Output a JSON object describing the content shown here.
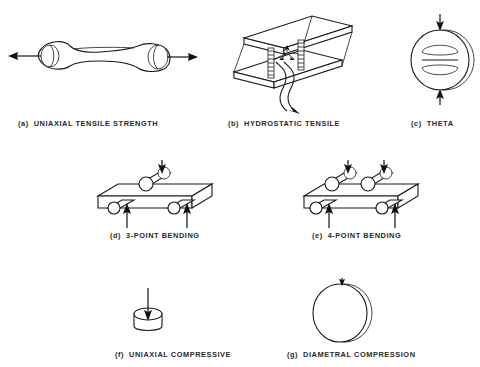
{
  "figure": {
    "background_color": "#ffffff",
    "line_color": "#1a1a1a",
    "caption_color": "#2a2a2a",
    "panel_count": 7
  },
  "panels": [
    {
      "tag": "(a)",
      "label": "UNIAXIAL TENSILE STRENGTH",
      "specimen": "dogbone-tensile-bar",
      "loading": "two opposing horizontal tensile arrows",
      "arrows": 2,
      "arrow_direction": "outward-horizontal"
    },
    {
      "tag": "(b)",
      "label": "HYDROSTATIC TENSILE",
      "specimen": "cylindrical-specimen-between-parallel-plates",
      "loading": "internal pressurized fluid via curved tube",
      "arrows": 3,
      "arrow_direction": "radial-outward"
    },
    {
      "tag": "(c)",
      "label": "THETA",
      "specimen": "theta-ring-with-central-web",
      "loading": "vertical compression across ring diameter",
      "arrows": 2,
      "arrow_direction": "inward-vertical",
      "clipped_at_right_edge": true
    },
    {
      "tag": "(d)",
      "label": "3-POINT BENDING",
      "specimen": "rectangular-beam",
      "loading": "one top roller, two bottom support rollers",
      "top_rollers": 1,
      "bottom_rollers": 2,
      "arrows": 3
    },
    {
      "tag": "(e)",
      "label": "4-POINT BENDING",
      "specimen": "rectangular-beam",
      "loading": "two top rollers, two bottom support rollers",
      "top_rollers": 2,
      "bottom_rollers": 2,
      "arrows": 4
    },
    {
      "tag": "(f)",
      "label": "UNIAXIAL COMPRESSIVE",
      "specimen": "short-cylinder",
      "loading": "single vertical downward load",
      "arrows": 1,
      "arrow_direction": "downward-vertical"
    },
    {
      "tag": "(g)",
      "label": "DIAMETRAL COMPRESSION",
      "specimen": "circular-disc",
      "loading": "point load on disc rim",
      "arrows": 1,
      "arrow_direction": "downward-vertical"
    }
  ]
}
